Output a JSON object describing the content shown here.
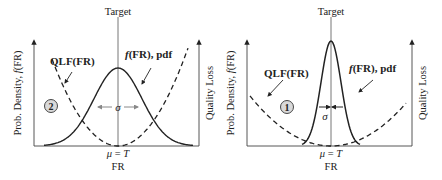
{
  "panels": [
    {
      "id": "panel-2",
      "badge": "2",
      "target_label": "Target",
      "y_left_label": "Prob. Density, f(FR)",
      "y_left_label_parts": [
        "Prob. Density, ",
        "f",
        "(FR)"
      ],
      "y_right_label": "Quality Loss",
      "x_label": "FR",
      "mean_label": "μ = T",
      "mean_label_parts": [
        "μ",
        " = ",
        "T"
      ],
      "qlf_label": "QLF(FR)",
      "pdf_label_parts": [
        "f",
        "(FR), pdf"
      ],
      "sigma_label": "σ",
      "spread": "wide",
      "sigma_arrow_direction": "outward"
    },
    {
      "id": "panel-1",
      "badge": "1",
      "target_label": "Target",
      "y_left_label": "Prob. Density, f(FR)",
      "y_left_label_parts": [
        "Prob. Density, ",
        "f",
        "(FR)"
      ],
      "y_right_label": "Quality Loss",
      "x_label": "FR",
      "mean_label": "μ = T",
      "mean_label_parts": [
        "μ",
        " = ",
        "T"
      ],
      "qlf_label": "QLF(FR)",
      "pdf_label_parts": [
        "f",
        "(FR), pdf"
      ],
      "sigma_label": "σ",
      "spread": "narrow",
      "sigma_arrow_direction": "inward"
    }
  ],
  "colors": {
    "ink": "#222222",
    "axis": "#555555",
    "badge_fill": "#d9d9d9"
  }
}
